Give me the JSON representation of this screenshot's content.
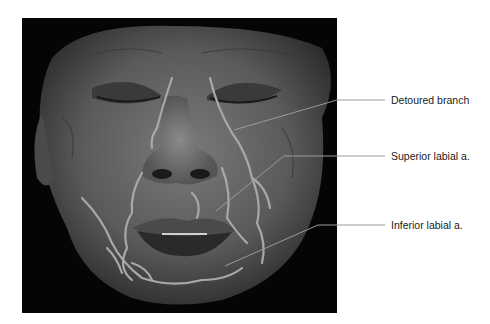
{
  "figure": {
    "labels": [
      {
        "id": "detoured-branch",
        "text": "Detoured branch"
      },
      {
        "id": "superior-labial",
        "text": "Superior labial a."
      },
      {
        "id": "inferior-labial",
        "text": "Inferior labial a."
      }
    ]
  }
}
